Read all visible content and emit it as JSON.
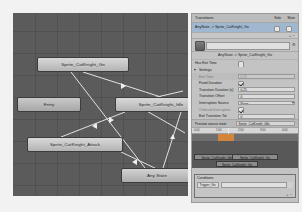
{
  "window": {
    "title": "Animator"
  },
  "graph": {
    "nodes": [
      {
        "id": "go",
        "label": "Sprite_CatKnight_Go",
        "x": 24,
        "y": 44,
        "w": 92,
        "h": 15
      },
      {
        "id": "entry",
        "label": "Entry",
        "x": 4,
        "y": 84,
        "w": 64,
        "h": 15
      },
      {
        "id": "idle",
        "label": "Sprite_CatKnight_Idle",
        "x": 102,
        "y": 84,
        "w": 92,
        "h": 15
      },
      {
        "id": "attack",
        "label": "Sprite_CatKnight_Attack",
        "x": 14,
        "y": 124,
        "w": 96,
        "h": 15
      },
      {
        "id": "any",
        "label": "Any State",
        "x": 108,
        "y": 155,
        "w": 72,
        "h": 15
      }
    ],
    "links": [
      {
        "from": "go",
        "to": "idle"
      },
      {
        "from": "go",
        "to": "any"
      },
      {
        "from": "idle",
        "to": "attack"
      },
      {
        "from": "attack",
        "to": "any"
      },
      {
        "from": "any",
        "to": "idle"
      },
      {
        "from": "idle",
        "to": "go"
      }
    ]
  },
  "inspector": {
    "transitions_header": "Transitions",
    "solo_label": "Solo",
    "mute_label": "Mute",
    "transition_rows": [
      {
        "name": "AnyState -> Sprite_CatKnight_Go"
      }
    ],
    "add_remove": "+  −",
    "name_field": "",
    "gear_icon": "⚙",
    "subtitle": "AnyState -> Sprite_CatKnight_Go",
    "properties": [
      {
        "label": "Has Exit Time",
        "type": "checkbox",
        "value": "",
        "indent": false,
        "dim": false,
        "checked": false
      },
      {
        "label": "Settings",
        "type": "foldout",
        "value": "",
        "indent": true,
        "dim": false
      },
      {
        "label": "Exit Time",
        "type": "field",
        "value": "0.75",
        "indent": true,
        "dim": true,
        "disabled": true
      },
      {
        "label": "Fixed Duration",
        "type": "checkbox",
        "value": "",
        "indent": true,
        "dim": false,
        "checked": true
      },
      {
        "label": "Transition Duration (s)",
        "type": "field",
        "value": "0.25",
        "indent": true,
        "dim": false
      },
      {
        "label": "Transition Offset",
        "type": "field",
        "value": "0",
        "indent": true,
        "dim": false
      },
      {
        "label": "Interruption Source",
        "type": "popup",
        "value": "None",
        "indent": true,
        "dim": false
      },
      {
        "label": "Ordered Interruption",
        "type": "checkbox",
        "value": "",
        "indent": true,
        "dim": true,
        "checked": true
      },
      {
        "label": "Exit Transition Tol.",
        "type": "field",
        "value": "0",
        "indent": true,
        "dim": false
      }
    ],
    "preview": {
      "source_label": "Preview source state",
      "source_value": "Sprite_CatKnight_Idle",
      "ruler_ticks": [
        "0:00",
        "1:00",
        "2:00",
        "3:00",
        "4:00"
      ],
      "clips": [
        {
          "label": "Sprite_CatKnight_Idle",
          "x": 2,
          "y": 20,
          "w": 46
        },
        {
          "label": "Sprite_CatKnight_Go",
          "x": 40,
          "y": 20,
          "w": 46
        },
        {
          "label": "Sprite_CatKnight_Go",
          "x": 24,
          "y": 27,
          "w": 42
        }
      ]
    },
    "conditions": {
      "header": "Conditions",
      "rows": [
        {
          "parameter": "Trigger_Go",
          "value": ""
        }
      ],
      "add_remove": "+  −"
    }
  }
}
